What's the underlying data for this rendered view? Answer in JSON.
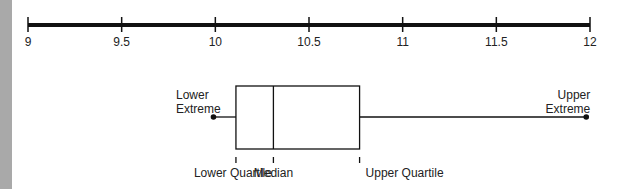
{
  "chart_data": {
    "type": "boxplot",
    "title": "",
    "axis": {
      "min": 9,
      "max": 12,
      "ticks": [
        9,
        9.5,
        10,
        10.5,
        11,
        11.5,
        12
      ],
      "tick_labels": [
        "9",
        "9.5",
        "10",
        "10.5",
        "11",
        "11.5",
        "12"
      ]
    },
    "box": {
      "lower_extreme": 9.99,
      "lower_quartile": 10.11,
      "median": 10.31,
      "upper_quartile": 10.77,
      "upper_extreme": 11.98
    },
    "annotations": {
      "lower_extreme": [
        "Lower",
        "Extreme"
      ],
      "upper_extreme": [
        "Upper",
        "Extreme"
      ],
      "lower_quartile": "Lower Quartile",
      "median": "Median",
      "upper_quartile": "Upper Quartile"
    }
  },
  "colors": {
    "line": "#111111",
    "strip": "#a9a9a9"
  }
}
